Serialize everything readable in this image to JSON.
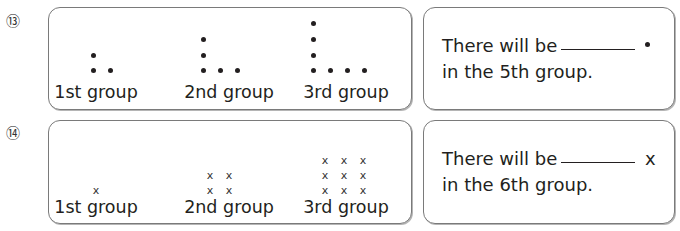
{
  "problems": [
    {
      "number": "⑬",
      "symbol": "dot",
      "groups": [
        {
          "label": "1st group",
          "count": 3
        },
        {
          "label": "2nd group",
          "count": 5
        },
        {
          "label": "3rd group",
          "count": 7
        }
      ],
      "answer": {
        "prefix": "There will be",
        "unit": "•",
        "line2": "in the 5th group."
      }
    },
    {
      "number": "⑭",
      "symbol": "x",
      "groups": [
        {
          "label": "1st group",
          "count": 1
        },
        {
          "label": "2nd group",
          "count": 4
        },
        {
          "label": "3rd group",
          "count": 9
        }
      ],
      "answer": {
        "prefix": "There will be",
        "unit": "x",
        "line2": "in the 6th group."
      }
    }
  ],
  "cross_glyph": "x"
}
